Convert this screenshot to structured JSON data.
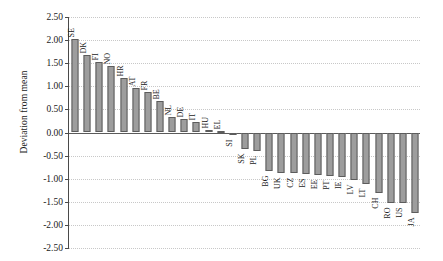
{
  "chart_data": {
    "type": "bar",
    "title": "",
    "xlabel": "",
    "ylabel": "Deviation from mean",
    "ylim": [
      -2.5,
      2.5
    ],
    "ytick_step": 0.5,
    "yticks": [
      "2.50",
      "2.00",
      "1.50",
      "1.00",
      "0.50",
      "0.00",
      "-0.50",
      "-1.00",
      "-1.50",
      "-2.00",
      "-2.50"
    ],
    "ytick_values": [
      2.5,
      2.0,
      1.5,
      1.0,
      0.5,
      0.0,
      -0.5,
      -1.0,
      -1.5,
      -2.0,
      -2.5
    ],
    "grid": true,
    "legend": null,
    "bar_color": "#9d9d9d",
    "bar_edge_color": "#5c5c5c",
    "zero_line_color": "#5a5a5a",
    "grid_color": "#c8c8c8",
    "categories": [
      "SE",
      "DK",
      "FI",
      "NO",
      "HR",
      "AT",
      "FR",
      "BE",
      "NL",
      "DE",
      "IT",
      "HU",
      "EL",
      "SI",
      "SK",
      "PL",
      "BG",
      "UK",
      "CZ",
      "ES",
      "EE",
      "PT",
      "IE",
      "LV",
      "LT",
      "CH",
      "RO",
      "US",
      "JA"
    ],
    "values": [
      2.03,
      1.67,
      1.53,
      1.44,
      1.18,
      0.96,
      0.88,
      0.69,
      0.33,
      0.3,
      0.22,
      0.06,
      0.01,
      -0.06,
      -0.35,
      -0.4,
      -0.84,
      -0.87,
      -0.88,
      -0.9,
      -0.92,
      -0.94,
      -0.96,
      -1.03,
      -1.12,
      -1.3,
      -1.52,
      -1.53,
      -1.74
    ]
  }
}
